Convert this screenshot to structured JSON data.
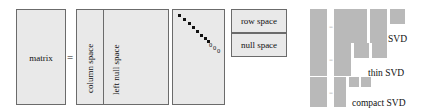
{
  "figure": {
    "background_color": "#ffffff",
    "panel_fill": "#e9e9e9",
    "panel_stroke": "#6b6b6b",
    "block_fill": "#b9b9b9",
    "text_color": "#111111"
  },
  "subspace_diagram": {
    "matrix_label": "matrix",
    "equals_sign": "=",
    "column_space_label": "column space",
    "left_null_space_label": "left null space",
    "row_space_label": "row space",
    "null_space_label": "null space",
    "sigma_zeros": [
      "0",
      "0",
      "0"
    ],
    "sigma_dot_count": 8
  },
  "svd_rows": [
    {
      "caption": "SVD",
      "equals_sign": "=",
      "blocks": [
        {
          "name": "A",
          "x": 310,
          "y": 9,
          "w": 17,
          "h": 34
        },
        {
          "name": "U",
          "x": 334,
          "y": 9,
          "w": 33,
          "h": 34
        },
        {
          "name": "Sigma",
          "x": 370,
          "y": 9,
          "w": 17,
          "h": 34
        },
        {
          "name": "Vt",
          "x": 390,
          "y": 9,
          "w": 15,
          "h": 15
        }
      ]
    },
    {
      "caption": "thin SVD",
      "equals_sign": "=",
      "blocks": [
        {
          "name": "A",
          "x": 310,
          "y": 43,
          "w": 17,
          "h": 33
        },
        {
          "name": "U",
          "x": 334,
          "y": 43,
          "w": 17,
          "h": 33
        },
        {
          "name": "Sigma",
          "x": 354,
          "y": 43,
          "w": 15,
          "h": 15
        },
        {
          "name": "Vt",
          "x": 372,
          "y": 43,
          "w": 15,
          "h": 15
        }
      ]
    },
    {
      "caption": "compact SVD",
      "equals_sign": "=",
      "blocks": [
        {
          "name": "A",
          "x": 310,
          "y": 77,
          "w": 17,
          "h": 30
        },
        {
          "name": "U",
          "x": 334,
          "y": 77,
          "w": 12,
          "h": 30
        },
        {
          "name": "Sigma",
          "x": 349,
          "y": 77,
          "w": 10,
          "h": 10
        },
        {
          "name": "Vt",
          "x": 361,
          "y": 77,
          "w": 10,
          "h": 10
        }
      ]
    }
  ]
}
